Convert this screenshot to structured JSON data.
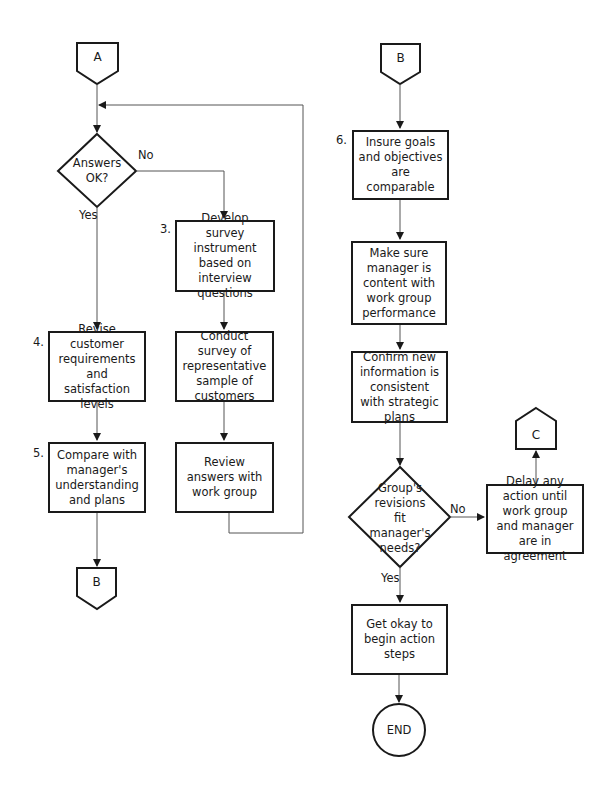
{
  "connectors": {
    "a_top": "A",
    "b_bottom_left": "B",
    "b_top_right": "B",
    "c_right": "C",
    "end": "END"
  },
  "decisions": {
    "answers_ok": "Answers OK?",
    "answers_ok_yes": "Yes",
    "answers_ok_no": "No",
    "revisions_fit": "Group's revisions fit manager's needs?",
    "revisions_fit_yes": "Yes",
    "revisions_fit_no": "No"
  },
  "steps": {
    "s3": {
      "number": "3.",
      "text": "Develop survey instrument based on interview questions"
    },
    "s3b": {
      "text": "Conduct survey of representative sample of customers"
    },
    "s3c": {
      "text": "Review answers with work group"
    },
    "s4": {
      "number": "4.",
      "text": "Revise customer requirements and satisfaction levels"
    },
    "s5": {
      "number": "5.",
      "text": "Compare with manager's understanding and plans"
    },
    "s6": {
      "number": "6.",
      "text": "Insure goals and objectives are comparable"
    },
    "s6b": {
      "text": "Make sure manager is content with work group performance"
    },
    "s6c": {
      "text": "Confirm new information is consistent with strategic plans"
    },
    "delay": {
      "text": "Delay any action until work group and manager are in agreement"
    },
    "get_okay": {
      "text": "Get okay to begin action steps"
    }
  },
  "colors": {
    "stroke": "#1a1a1a",
    "line": "#555555",
    "background": "#ffffff"
  }
}
